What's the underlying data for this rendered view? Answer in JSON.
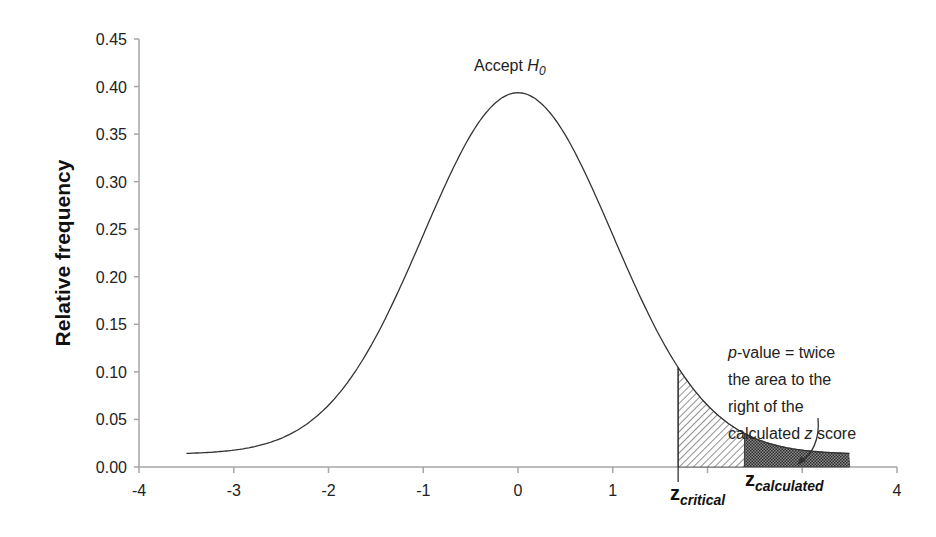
{
  "chart_data": {
    "type": "line",
    "title": "",
    "xlabel": "",
    "ylabel": "Relative frequency",
    "xlim": [
      -4,
      4
    ],
    "ylim": [
      0,
      0.45
    ],
    "x_ticks": [
      "-4",
      "-3",
      "-2",
      "-1",
      "0",
      "1",
      "",
      "",
      "4"
    ],
    "x_tick_values": [
      -4,
      -3,
      -2,
      -1,
      0,
      1,
      2,
      3,
      4
    ],
    "y_ticks": [
      "0.00",
      "0.05",
      "0.10",
      "0.15",
      "0.20",
      "0.25",
      "0.30",
      "0.35",
      "0.40",
      "0.45"
    ],
    "grid": false,
    "legend": null,
    "series": [
      {
        "name": "Standard normal distribution (relative frequency)",
        "x": [
          -3.5,
          -3,
          -2.5,
          -2,
          -1.5,
          -1,
          -0.5,
          0,
          0.5,
          1,
          1.5,
          2,
          2.5,
          3,
          3.5
        ],
        "values": [
          0.014,
          0.017,
          0.03,
          0.065,
          0.134,
          0.243,
          0.349,
          0.393,
          0.349,
          0.243,
          0.134,
          0.065,
          0.03,
          0.017,
          0.014
        ]
      }
    ],
    "shaded_regions": [
      {
        "name": "critical-region",
        "from": 1.69,
        "to": 2.39,
        "pattern": "diagonal-hatch"
      },
      {
        "name": "p-value-region",
        "from": 2.39,
        "to": 3.5,
        "pattern": "dotted-dark"
      }
    ],
    "markers": {
      "z_critical": 1.69,
      "z_calculated": 2.39
    },
    "annotations": [
      {
        "text": "Accept H0",
        "x": 0,
        "y": 0.41
      },
      {
        "text": "p-value = twice the area to the right of the calculated z score",
        "x": 3.0,
        "y": 0.15,
        "arrow_to": [
          3.05,
          0.005
        ]
      }
    ]
  },
  "labels": {
    "ylabel": "Relative frequency",
    "accept_main": "Accept ",
    "accept_h": "H",
    "accept_sub": "0",
    "annot_p": "p",
    "annot_line1": "-value = twice",
    "annot_line2": "the area to the",
    "annot_line3": "right of the",
    "annot_line4a": "calculated ",
    "annot_line4z": "z",
    "annot_line4b": " score",
    "zcrit_z": "z",
    "zcrit_sub": "critical",
    "zcalc_z": "z",
    "zcalc_sub": "calculated"
  },
  "colors": {
    "axis": "#a6a6a6",
    "curve": "#333333",
    "hatch": "#555555",
    "dots": "#3a3a3a",
    "text": "#222222"
  }
}
